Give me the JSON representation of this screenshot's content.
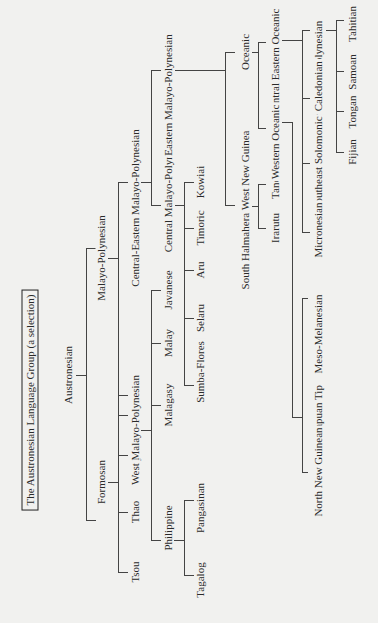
{
  "title": "The Austronesian Language Group (a selection)",
  "diagram_type": "tree",
  "orientation": "rotated-90-ccw",
  "colors": {
    "background": "#f1f1ef",
    "line": "#444444",
    "text": "#2a2a2a"
  },
  "nodes": {
    "austronesian": "Austronesian",
    "formosan": "Formosan",
    "tsou": "Tsou",
    "thao": "Thao",
    "puyama": "Puyama",
    "rukai": "Rukai",
    "malayo_polynesian": "Malayo-Polynesian",
    "west_mp": "West Malayo-Polynesian",
    "philippine": "Philippine",
    "tagalog": "Tagalog",
    "pangasinan": "Pangasinan",
    "malagasy": "Malagasy",
    "malay": "Malay",
    "javanese": "Javanese",
    "central_eastern_mp": "Central-Eastern Malayo-Polynesian",
    "central_mp": "Central Malayo-Polynesian",
    "sumba_flores": "Sumba-Flores",
    "selaru": "Selaru",
    "aru": "Aru",
    "timoric": "Timoric",
    "kowiai": "Kowiai",
    "eastern_mp": "Eastern Malayo-Polynesian",
    "shwng": "South Halmahera West New Guinea",
    "irarutu": "Irarutu",
    "tandia": "Tandia",
    "oceanic": "Oceanic",
    "western_oceanic": "Western Oceanic",
    "north_new_guinean": "North New Guinean",
    "papuan_tip": "Papuan Tip",
    "meso_melanesian": "Meso-Melanesian",
    "central_eastern_oceanic": "Central Eastern Oceanic",
    "micronesian": "Micronesian",
    "southeast_solomonic": "Southeast Solomonic",
    "new_caledonian": "New Caledonian",
    "polynesian": "Polynesian",
    "fijian": "Fijian",
    "tongan": "Tongan",
    "samoan": "Samoan",
    "tahitian": "Tahitian"
  },
  "tree": {
    "Austronesian": {
      "Formosan": [
        "Tsou",
        "Thao",
        "Puyama",
        "Rukai"
      ],
      "Malayo-Polynesian": {
        "West Malayo-Polynesian": {
          "Philippine": [
            "Tagalog",
            "Pangasinan"
          ],
          "Malagasy": [],
          "Malay": [],
          "Javanese": []
        },
        "Central-Eastern Malayo-Polynesian": {
          "Central Malayo-Polynesian": [
            "Sumba-Flores",
            "Selaru",
            "Aru",
            "Timoric",
            "Kowiai"
          ],
          "Eastern Malayo-Polynesian": {
            "South Halmahera West New Guinea": [
              "Irarutu",
              "Tandia"
            ],
            "Oceanic": {
              "Western Oceanic": {
                "North New Guinean": [],
                "Papuan Tip": [],
                "Meso-Melanesian": []
              },
              "Central Eastern Oceanic": {
                "Micronesian": [],
                "Southeast Solomonic": [],
                "New Caledonian": [],
                "Polynesian": [
                  "Fijian",
                  "Tongan",
                  "Samoan",
                  "Tahitian"
                ]
              }
            }
          }
        }
      }
    }
  }
}
